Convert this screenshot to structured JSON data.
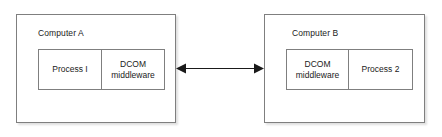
{
  "diagram": {
    "title_present": false,
    "colors": {
      "border": "#7f7f7f",
      "text": "#1a1a1a",
      "background": "#ffffff",
      "arrow": "#1a1a1a"
    },
    "computers": [
      {
        "id": "a",
        "label": "Computer A",
        "cells": [
          {
            "name": "process",
            "text": "Process I"
          },
          {
            "name": "middleware",
            "text": "DCOM\nmiddleware"
          }
        ]
      },
      {
        "id": "b",
        "label": "Computer B",
        "cells": [
          {
            "name": "middleware",
            "text": "DCOM\nmiddleware"
          },
          {
            "name": "process",
            "text": "Process 2"
          }
        ]
      }
    ],
    "connector": {
      "name": "bidirectional-arrow",
      "style": "double-headed",
      "label": ""
    }
  }
}
